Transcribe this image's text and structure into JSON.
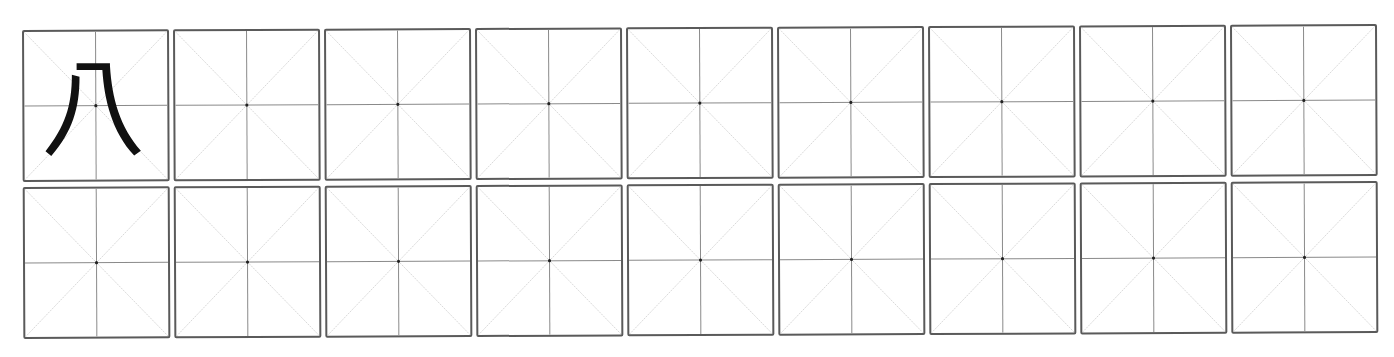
{
  "worksheet": {
    "type": "米字格 practice grid",
    "rows": 2,
    "columns": 9,
    "model_character": "几",
    "model_cell": {
      "row": 0,
      "column": 0
    },
    "colors": {
      "border": "#5a5a5a",
      "center_lines": "#8a8a8a",
      "diagonals": "#c8c8c8",
      "center_dot": "#222222",
      "glyph": "#111111",
      "background": "#ffffff"
    }
  }
}
